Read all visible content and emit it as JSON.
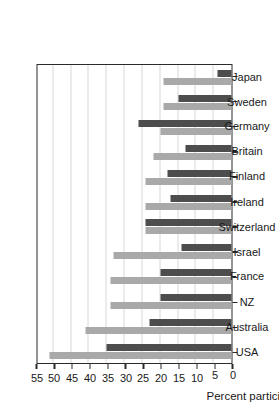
{
  "chart_data": {
    "type": "bar",
    "title": "",
    "subtitle": "",
    "xlabel": "",
    "ylabel": "Percent participating",
    "ylim": [
      0,
      55
    ],
    "ytick_step": 5,
    "grid": true,
    "legend": "none",
    "orientation": "vertical-bars-rotated-90",
    "categories": [
      "USA",
      "Australia",
      "NZ",
      "France",
      "Israel",
      "Switzerland",
      "Ireland",
      "Finland",
      "Britain",
      "Germany",
      "Sweden",
      "Japan"
    ],
    "yticks": [
      0,
      5,
      10,
      15,
      20,
      25,
      30,
      35,
      40,
      45,
      50,
      55
    ],
    "series": [
      {
        "name": "series-a",
        "color": "#a9a9a9",
        "values": [
          51,
          41,
          34,
          34,
          33,
          24,
          24,
          24,
          22,
          20,
          19,
          19
        ]
      },
      {
        "name": "series-b",
        "color": "#4d4d4d",
        "values": [
          35,
          23,
          20,
          20,
          14,
          24,
          17,
          18,
          13,
          26,
          15,
          4
        ]
      }
    ]
  },
  "axis": {
    "value_axis_title": "Percent participating"
  },
  "colors": {
    "series_a": "#a9a9a9",
    "series_b": "#4d4d4d",
    "axis": "#2b2b2b",
    "grid": "#d8d8d8",
    "background": "#ffffff"
  }
}
